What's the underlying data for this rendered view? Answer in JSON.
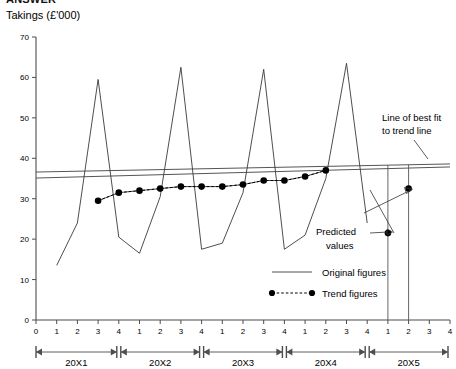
{
  "header": {
    "clipped_title": "ANSWER",
    "y_axis_title": "Takings (£'000)"
  },
  "chart_data": {
    "type": "line",
    "title": "Takings (£'000)",
    "xlabel": "",
    "ylabel": "Takings (£'000)",
    "ylim": [
      0,
      70
    ],
    "yticks": [
      0,
      10,
      20,
      30,
      40,
      50,
      60,
      70
    ],
    "grid": false,
    "legend_position": "bottom-right",
    "x_tick_labels": [
      "0",
      "1",
      "2",
      "3",
      "4",
      "1",
      "2",
      "3",
      "4",
      "1",
      "2",
      "3",
      "4",
      "1",
      "2",
      "3",
      "4",
      "1",
      "2",
      "3",
      "4"
    ],
    "year_bands": [
      "20X1",
      "20X2",
      "20X3",
      "20X4",
      "20X5"
    ],
    "quarters_per_year": 4,
    "series": [
      {
        "name": "Original figures",
        "style": "solid",
        "x": [
          1,
          2,
          3,
          4,
          5,
          6,
          7,
          8,
          9,
          10,
          11,
          12,
          13,
          14,
          15,
          16
        ],
        "values": [
          13.5,
          24.0,
          59.5,
          20.5,
          16.5,
          30.5,
          62.5,
          17.5,
          19.0,
          31.5,
          62.0,
          17.5,
          21.0,
          35.0,
          63.5,
          24.0
        ]
      },
      {
        "name": "Trend figures",
        "style": "dotted-with-markers",
        "x": [
          3,
          4,
          5,
          6,
          7,
          8,
          9,
          10,
          11,
          12,
          13,
          14
        ],
        "values": [
          29.5,
          31.5,
          32.0,
          32.5,
          33.0,
          33.0,
          33.0,
          33.5,
          34.5,
          34.5,
          35.5,
          37.0
        ]
      },
      {
        "name": "Predicted values",
        "style": "markers-only",
        "x": [
          17,
          18
        ],
        "values": [
          21.5,
          32.5
        ]
      }
    ],
    "best_fit_line": {
      "label": "Line of best fit to trend line",
      "start": {
        "x": 0.0,
        "y": 36.6
      },
      "end": {
        "x": 20.0,
        "y": 38.6
      }
    },
    "annotations": [
      {
        "name": "best-fit-annotation",
        "text_line1": "Line of best fit",
        "text_line2": "to trend line"
      },
      {
        "name": "predicted-values-annotation",
        "text_line1": "Predicted",
        "text_line2": "values"
      }
    ],
    "legend": [
      {
        "label": "Original figures",
        "marker": "line"
      },
      {
        "label": "Trend figures",
        "marker": "dotted-line-with-dots"
      }
    ]
  }
}
